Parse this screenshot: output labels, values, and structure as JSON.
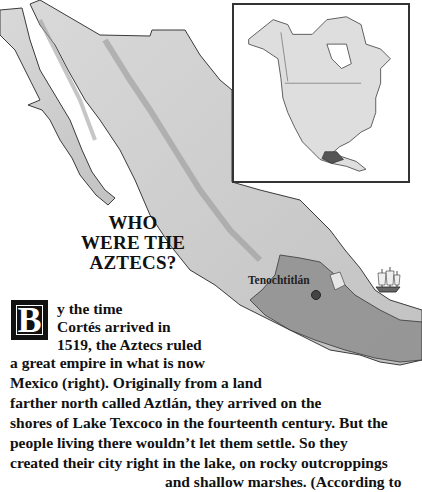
{
  "heading": {
    "lines": [
      "WHO",
      "WERE THE",
      "AZTECS?"
    ]
  },
  "map": {
    "city_label": "Tenochtitlán",
    "inset_caption": "",
    "colors": {
      "land_light": "#e2e2e2",
      "land_mid": "#bdbdbd",
      "empire": "#8f8f8f",
      "outline": "#3a3a3a",
      "inset_border": "#333333"
    }
  },
  "body": {
    "drop_cap": "B",
    "lines": [
      "y the time",
      "Cortés arrived in",
      "1519, the Aztecs ruled",
      "a great empire in what is now",
      "Mexico (right). Originally from a land",
      "farther north called Aztlán, they arrived on the",
      "shores of Lake Texcoco in the fourteenth century. But the",
      "people living there wouldn’t let them settle. So they",
      "created their city right in the lake, on rocky outcroppings",
      "and shallow marshes. (According to"
    ]
  }
}
